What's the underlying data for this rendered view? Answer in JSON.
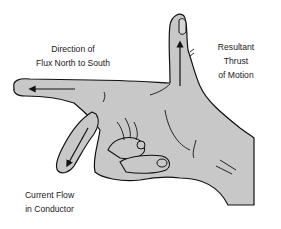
{
  "diagram": {
    "colors": {
      "hand_fill": "#c8c8c8",
      "outline": "#111111",
      "text": "#1a1a1a",
      "background": "#ffffff"
    },
    "labels": {
      "flux": {
        "line1": "Direction of",
        "line2": "Flux North to South"
      },
      "thrust": {
        "line1": "Resultant",
        "line2": "Thrust",
        "line3": "of Motion"
      },
      "current": {
        "line1": "Current Flow",
        "line2": "in Conductor"
      }
    },
    "arrows": [
      {
        "name": "flux-arrow",
        "finger": "index finger",
        "direction": "left"
      },
      {
        "name": "thrust-arrow",
        "finger": "thumb",
        "direction": "up"
      },
      {
        "name": "current-arrow",
        "finger": "middle finger",
        "direction": "down-left"
      }
    ]
  }
}
